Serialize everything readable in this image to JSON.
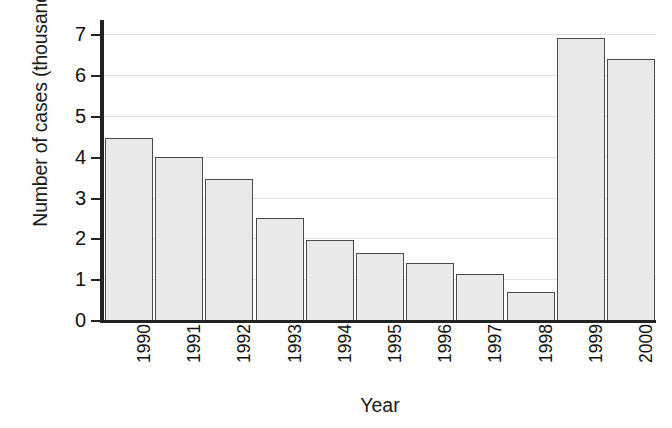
{
  "chart_data": {
    "type": "bar",
    "title": "",
    "xlabel": "Year",
    "ylabel": "Number of cases (thousands)",
    "categories": [
      "1990",
      "1991",
      "1992",
      "1993",
      "1994",
      "1995",
      "1996",
      "1997",
      "1998",
      "1999",
      "2000"
    ],
    "values": [
      4.45,
      4.0,
      3.45,
      2.5,
      1.97,
      1.65,
      1.4,
      1.12,
      0.68,
      6.92,
      6.4
    ],
    "ylim": [
      0,
      7.35
    ],
    "yticks": [
      0,
      1,
      2,
      3,
      4,
      5,
      6,
      7
    ],
    "ytick_labels": [
      "0",
      "1",
      "2",
      "3",
      "4",
      "5",
      "6",
      "7"
    ],
    "grid": true,
    "grid_axis": "y",
    "legend": "none",
    "bar_fill_color": "#e9e9e9",
    "bar_edge_color": "#4a4a4a",
    "axis_color": "#222222",
    "grid_color": "#e2e2e2",
    "background_color": "#ffffff"
  }
}
